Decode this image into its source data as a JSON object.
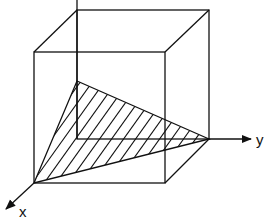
{
  "diagram": {
    "type": "3d-cube-plane-section",
    "axes": {
      "x_label": "x",
      "y_label": "y",
      "z_label": ""
    },
    "shape": {
      "name": "cube",
      "shaded_region": "triangle",
      "shading": "hatched"
    },
    "colors": {
      "stroke": "#111111",
      "background": "#ffffff"
    }
  }
}
